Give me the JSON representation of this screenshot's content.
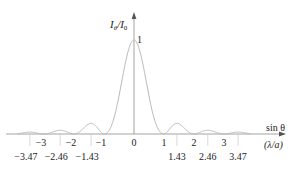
{
  "chart_data": {
    "type": "line",
    "title": "",
    "ylabel": "I_θ/I_0",
    "ylabel_main": "I",
    "ylabel_sub1": "θ",
    "ylabel_slash": "/I",
    "ylabel_sub2": "0",
    "xlabel_line1": "sin θ",
    "xlabel_line2": "(λ/a)",
    "y_peak_label": "1",
    "x_range": [
      -3.9,
      3.9
    ],
    "y_range": [
      0,
      1
    ],
    "grid": false,
    "legend": null,
    "function": "single-slit diffraction intensity (sin(u)/u)^2, u = π·sinθ/(λ/a)",
    "integer_ticks": [
      "-3",
      "-2",
      "-1",
      "0",
      "1",
      "2",
      "3"
    ],
    "integer_tick_values": [
      -3,
      -2,
      -1,
      0,
      1,
      2,
      3
    ],
    "secondary_max_ticks": [
      "-3.47",
      "-2.46",
      "-1.43",
      "1.43",
      "2.46",
      "3.47"
    ],
    "secondary_max_values": [
      -3.47,
      -2.46,
      -1.43,
      1.43,
      2.46,
      3.47
    ],
    "series": [
      {
        "name": "I_θ/I_0",
        "x": [
          -3.9,
          -3.47,
          -3.0,
          -2.46,
          -2.0,
          -1.43,
          -1.0,
          -0.5,
          0,
          0.5,
          1.0,
          1.43,
          2.0,
          2.46,
          3.0,
          3.47,
          3.9
        ],
        "values": [
          0.0,
          0.008,
          0.0,
          0.016,
          0.0,
          0.047,
          0.0,
          0.405,
          1.0,
          0.405,
          0.0,
          0.047,
          0.0,
          0.016,
          0.0,
          0.008,
          0.0
        ]
      }
    ]
  },
  "colors": {
    "curve": "#b8b8b8",
    "axis": "#9a9a9a",
    "text": "#222222"
  }
}
